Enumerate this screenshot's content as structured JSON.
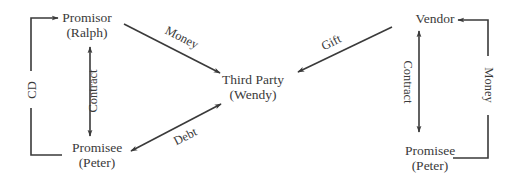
{
  "left_diagram": {
    "nodes": {
      "promisor": {
        "role": "Promisor",
        "name": "(Ralph)"
      },
      "promisee": {
        "role": "Promisee",
        "name": "(Peter)"
      },
      "third_party": {
        "role": "Third Party",
        "name": "(Wendy)"
      }
    },
    "edges": {
      "cd": {
        "label": "CD",
        "from": "promisee",
        "to": "promisor",
        "direction": "one-way"
      },
      "contract": {
        "label": "Contract",
        "from": "promisor",
        "to": "promisee",
        "direction": "two-way"
      },
      "money": {
        "label": "Money",
        "from": "promisor",
        "to": "third_party",
        "direction": "one-way"
      },
      "debt": {
        "label": "Debt",
        "from": "promisee",
        "to": "third_party",
        "direction": "two-way"
      }
    }
  },
  "right_diagram": {
    "nodes": {
      "vendor": {
        "role": "Vendor"
      },
      "promisee": {
        "role": "Promisee",
        "name": "(Peter)"
      }
    },
    "edges": {
      "gift": {
        "label": "Gift",
        "from": "vendor",
        "to": "third_party",
        "direction": "one-way"
      },
      "contract": {
        "label": "Contract",
        "from": "vendor",
        "to": "promisee",
        "direction": "two-way"
      },
      "money": {
        "label": "Money",
        "from": "promisee",
        "to": "vendor",
        "direction": "one-way"
      }
    }
  },
  "colors": {
    "ink": "#3a3a3a",
    "background": "#ffffff"
  }
}
